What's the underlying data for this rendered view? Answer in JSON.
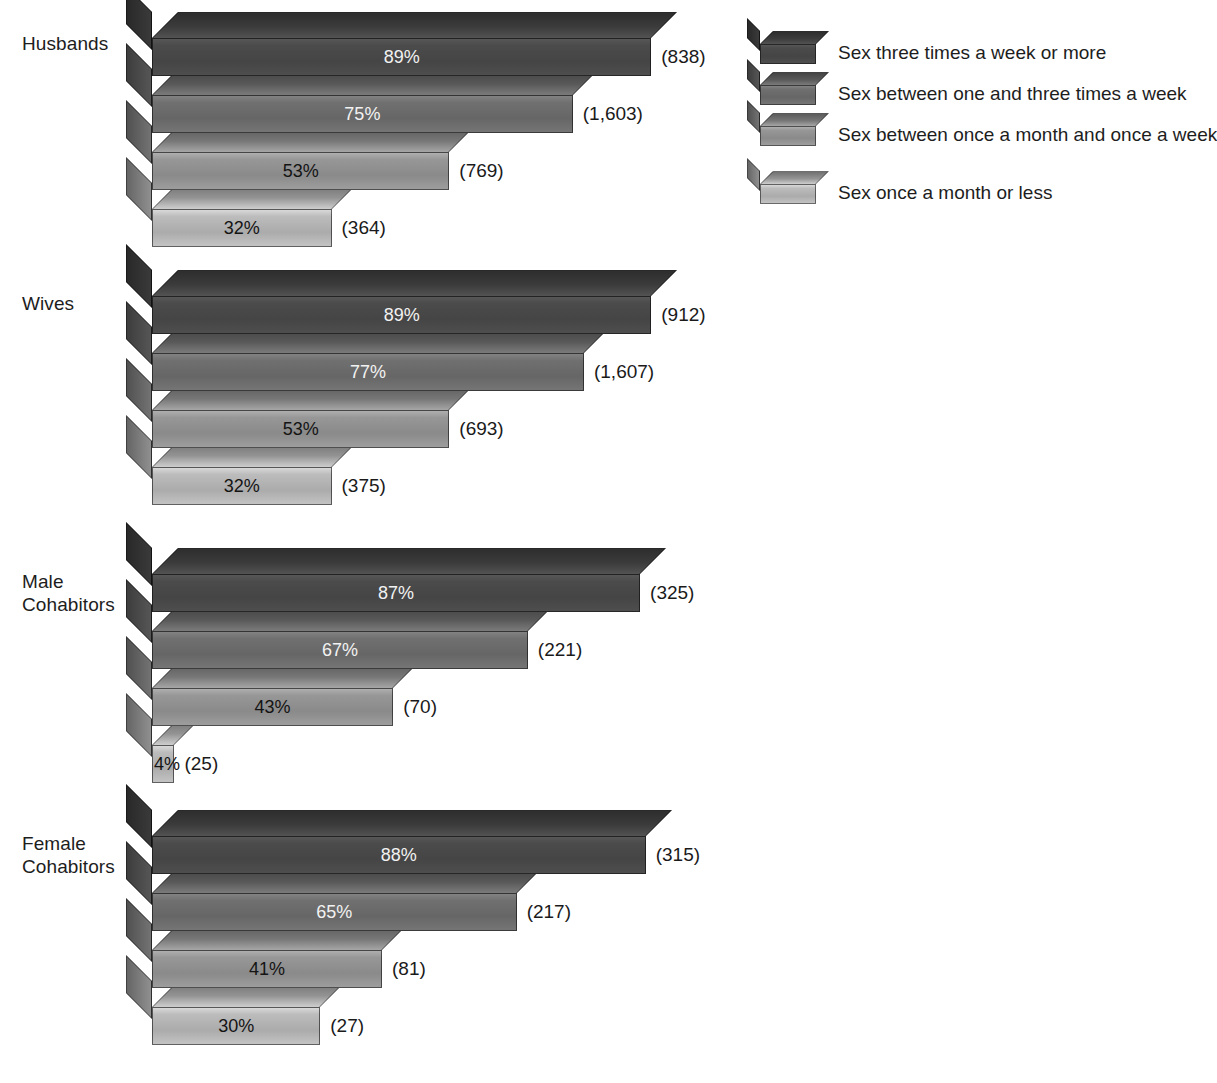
{
  "chart_data": {
    "type": "bar",
    "orientation": "horizontal",
    "style": "3d-bar",
    "title": "",
    "subtitle": "",
    "xlabel": "",
    "ylabel": "",
    "xlim": [
      0,
      100
    ],
    "grid": false,
    "value_suffix": "%",
    "legend_position": "right-top",
    "categories": [
      "Husbands",
      "Wives",
      "Male Cohabitors",
      "Female Cohabitors"
    ],
    "series": [
      {
        "name": "Sex three times a week or more",
        "color": "#4a4a4a",
        "values": [
          89,
          89,
          87,
          88
        ],
        "counts": [
          "(838)",
          "(912)",
          "(325)",
          "(315)"
        ],
        "value_labels": [
          "89%",
          "89%",
          "87%",
          "88%"
        ]
      },
      {
        "name": "Sex between one and three times a week",
        "color": "#6e6e6e",
        "values": [
          75,
          77,
          67,
          65
        ],
        "counts": [
          "(1,603)",
          "(1,607)",
          "(221)",
          "(217)"
        ],
        "value_labels": [
          "75%",
          "77%",
          "67%",
          "65%"
        ]
      },
      {
        "name": "Sex between once a month and once a week",
        "color": "#949494",
        "values": [
          53,
          53,
          43,
          41
        ],
        "counts": [
          "(769)",
          "(693)",
          "(70)",
          "(81)"
        ],
        "value_labels": [
          "53%",
          "53%",
          "43%",
          "41%"
        ]
      },
      {
        "name": "Sex once a month or less",
        "color": "#b8b8b8",
        "values": [
          32,
          32,
          4,
          30
        ],
        "counts": [
          "(364)",
          "(375)",
          "(25)",
          "(27)"
        ],
        "value_labels": [
          "32%",
          "32%",
          "4%",
          "30%"
        ]
      }
    ]
  },
  "groups": [
    {
      "label": "Husbands",
      "label_top": 32,
      "row_top": 38
    },
    {
      "label": "Wives",
      "label_top": 292,
      "row_top": 296
    },
    {
      "label": "Male Cohabitors",
      "label_top": 570,
      "row_top": 574
    },
    {
      "label": "Female Cohabitors",
      "label_top": 832,
      "row_top": 836
    }
  ],
  "legend": {
    "items": [
      {
        "label": "Sex three times a week or more",
        "top": 0,
        "color": "#4a4a4a"
      },
      {
        "label": "Sex between one and three times a week",
        "top": 41,
        "color": "#6e6e6e"
      },
      {
        "label": "Sex between once a month and once a week",
        "top": 82,
        "color": "#949494"
      },
      {
        "label": "Sex once a month or less",
        "top": 140,
        "color": "#b8b8b8"
      }
    ]
  }
}
